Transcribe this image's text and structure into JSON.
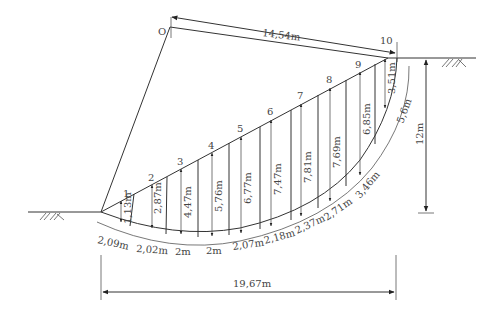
{
  "diagram": {
    "type": "slope-stability-slice-method",
    "center_label": "O",
    "radius_label": "14,54m",
    "span_label": "19,67m",
    "height_label": "12m",
    "slices": [
      {
        "id": "1",
        "height": "1,13m",
        "base": "2,09m"
      },
      {
        "id": "2",
        "height": "2,87m",
        "base": "2,02m"
      },
      {
        "id": "3",
        "height": "4,47m",
        "base": "2m"
      },
      {
        "id": "4",
        "height": "5,76m",
        "base": "2m"
      },
      {
        "id": "5",
        "height": "6,77m",
        "base": "2,07m"
      },
      {
        "id": "6",
        "height": "7,47m",
        "base": "2,18m"
      },
      {
        "id": "7",
        "height": "7,81m",
        "base": "2,37m"
      },
      {
        "id": "8",
        "height": "7,69m",
        "base": "2,71m"
      },
      {
        "id": "9",
        "height": "6,85m",
        "base": "3,46m"
      },
      {
        "id": "10",
        "height": "3,51m",
        "base": "5,6m"
      }
    ]
  }
}
